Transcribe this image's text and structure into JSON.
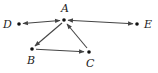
{
  "diagram": {
    "type": "directed-graph",
    "colors": {
      "edge": "#444444",
      "node": "#111111",
      "label": "#222222"
    },
    "nodes": [
      {
        "id": "A",
        "label": "A",
        "x": 64,
        "y": 20
      },
      {
        "id": "B",
        "label": "B",
        "x": 32,
        "y": 49
      },
      {
        "id": "C",
        "label": "C",
        "x": 89,
        "y": 52
      },
      {
        "id": "D",
        "label": "D",
        "x": 19,
        "y": 24
      },
      {
        "id": "E",
        "label": "E",
        "x": 137,
        "y": 24
      }
    ],
    "edges": [
      {
        "from": "A",
        "to": "D",
        "bidirectional": true
      },
      {
        "from": "A",
        "to": "E",
        "bidirectional": true
      },
      {
        "from": "A",
        "to": "B",
        "bidirectional": false
      },
      {
        "from": "B",
        "to": "C",
        "bidirectional": false
      },
      {
        "from": "C",
        "to": "A",
        "bidirectional": false
      }
    ]
  }
}
